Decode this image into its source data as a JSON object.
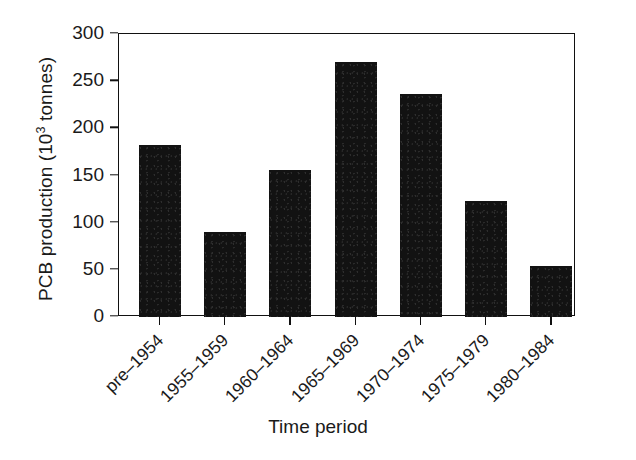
{
  "chart_data": {
    "type": "bar",
    "title": "",
    "xlabel": "Time period",
    "ylabel": "PCB production (10³ tonnes)",
    "ylabel_parts": {
      "prefix": "PCB production (10",
      "superscript": "3",
      "suffix": " tonnes)"
    },
    "categories": [
      "pre–1954",
      "1955–1959",
      "1960–1964",
      "1965–1969",
      "1970–1974",
      "1975–1979",
      "1980–1984"
    ],
    "values": [
      182,
      90,
      156,
      270,
      236,
      123,
      54
    ],
    "ylim": [
      0,
      300
    ],
    "yticks": [
      0,
      50,
      100,
      150,
      200,
      250,
      300
    ],
    "ytick_labels": [
      "0",
      "50",
      "100",
      "150",
      "200",
      "250",
      "300"
    ],
    "grid": false,
    "legend": false,
    "bar_color": "#121212",
    "axis_color": "#111111",
    "background_color": "#ffffff"
  }
}
